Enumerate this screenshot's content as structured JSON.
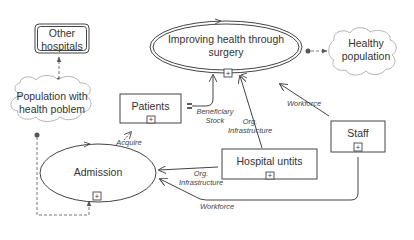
{
  "diagram": {
    "type": "stock-flow / system diagram",
    "nodes": {
      "other_hospitals": {
        "label_line1": "Other",
        "label_line2": "hospitals",
        "shape": "rounded-double-box"
      },
      "population_health_problem": {
        "label_line1": "Population with",
        "label_line2": "health poblem",
        "shape": "cloud"
      },
      "improving_health": {
        "label_line1": "Improving health through",
        "label_line2": "surgery",
        "shape": "double-ellipse",
        "expand": "+"
      },
      "healthy_population": {
        "label_line1": "Healthy",
        "label_line2": "population",
        "shape": "cloud"
      },
      "patients": {
        "label": "Patients",
        "shape": "box",
        "expand": "+"
      },
      "admission": {
        "label": "Admission",
        "shape": "ellipse",
        "expand": "+"
      },
      "hospital_units": {
        "label": "Hospital untits",
        "shape": "box",
        "expand": "+"
      },
      "staff": {
        "label": "Staff",
        "shape": "box",
        "expand": "+"
      }
    },
    "edges": {
      "beneficiary_stock": {
        "line1": "Beneficiary",
        "line2": "Stock"
      },
      "org_infrastructure_top": {
        "line1": "Org.",
        "line2": "Infrastructure"
      },
      "workforce_top": {
        "label": "Workforce"
      },
      "acquire": {
        "label": "Acquire"
      },
      "org_infrastructure_bottom": {
        "line1": "Org.",
        "line2": "Infrastructure"
      },
      "workforce_bottom": {
        "label": "Workforce"
      }
    },
    "colors": {
      "line": "#444444",
      "cloud_stroke": "#b0b0b0",
      "dashed": "#777777",
      "text": "#333333"
    }
  }
}
